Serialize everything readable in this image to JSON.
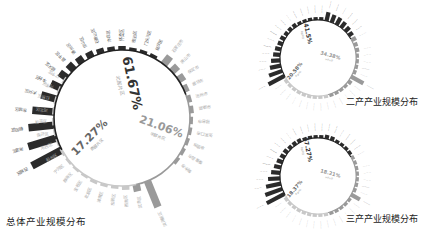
{
  "colors": {
    "dark": "#2b2b2b",
    "mid": "#9a9a9a",
    "light": "#c8c8c8",
    "ring": "#555555",
    "label": "#888888"
  },
  "chart_data": [
    {
      "type": "radial-bar",
      "title": "总体产业规模分布",
      "center": [
        122,
        118
      ],
      "radius": 68,
      "segments": [
        {
          "pct": "61.67%",
          "sub": "北部片区",
          "color": "dark",
          "start": -118,
          "end": 70,
          "labelPos": [
            128,
            84
          ],
          "rot": 78,
          "size": 13
        },
        {
          "pct": "21.06%",
          "sub": "中部片区",
          "color": "mid",
          "start": 70,
          "end": 168,
          "labelPos": [
            160,
            130
          ],
          "rot": 20,
          "size": 11
        },
        {
          "pct": "17.27%",
          "sub": "南部片区",
          "color": "light",
          "start": 168,
          "end": 242,
          "labelPos": [
            92,
            140
          ],
          "rot": -45,
          "size": 11
        }
      ],
      "bars": [
        {
          "name": "西城区",
          "angle": -118,
          "len": 34,
          "color": "dark"
        },
        {
          "name": "海淀区",
          "angle": -107,
          "len": 30,
          "color": "dark"
        },
        {
          "name": "朝阳区",
          "angle": -96,
          "len": 26,
          "color": "dark"
        },
        {
          "name": "东城区",
          "angle": -85,
          "len": 22,
          "color": "dark"
        },
        {
          "name": "大兴区",
          "angle": -74,
          "len": 16,
          "color": "dark"
        },
        {
          "name": "丰台区",
          "angle": -64,
          "len": 11,
          "color": "dark"
        },
        {
          "name": "顺义区",
          "angle": -54,
          "len": 9,
          "color": "dark"
        },
        {
          "name": "昌平区",
          "angle": -45,
          "len": 8,
          "color": "dark"
        },
        {
          "name": "通州区",
          "angle": -36,
          "len": 7,
          "color": "dark"
        },
        {
          "name": "房山区",
          "angle": -27,
          "len": 6,
          "color": "dark"
        },
        {
          "name": "石景山区",
          "angle": -18,
          "len": 5,
          "color": "dark"
        },
        {
          "name": "亦庄区",
          "angle": -9,
          "len": 4,
          "color": "dark"
        },
        {
          "name": "怀柔区",
          "angle": 0,
          "len": 4,
          "color": "dark"
        },
        {
          "name": "密云区",
          "angle": 9,
          "len": 3,
          "color": "dark"
        },
        {
          "name": "门头沟区",
          "angle": 18,
          "len": 3,
          "color": "dark"
        },
        {
          "name": "延庆区",
          "angle": 27,
          "len": 3,
          "color": "dark"
        },
        {
          "name": "石家庄市",
          "angle": 38,
          "len": 10,
          "color": "mid"
        },
        {
          "name": "唐山市",
          "angle": 47,
          "len": 8,
          "color": "mid"
        },
        {
          "name": "保定市",
          "angle": 56,
          "len": 7,
          "color": "mid"
        },
        {
          "name": "廊坊市",
          "angle": 65,
          "len": 5,
          "color": "mid"
        },
        {
          "name": "沧州市",
          "angle": 74,
          "len": 4,
          "color": "mid"
        },
        {
          "name": "邯郸市",
          "angle": 83,
          "len": 4,
          "color": "mid"
        },
        {
          "name": "邢台市",
          "angle": 92,
          "len": 3,
          "color": "mid"
        },
        {
          "name": "张家口市",
          "angle": 101,
          "len": 3,
          "color": "mid"
        },
        {
          "name": "承德市",
          "angle": 110,
          "len": 3,
          "color": "mid"
        },
        {
          "name": "秦皇岛市",
          "angle": 119,
          "len": 3,
          "color": "mid"
        },
        {
          "name": "衡水市",
          "angle": 128,
          "len": 3,
          "color": "mid"
        },
        {
          "name": "滨海新区",
          "angle": 158,
          "len": 28,
          "color": "mid"
        },
        {
          "name": "武清区",
          "angle": 168,
          "len": 7,
          "color": "mid"
        },
        {
          "name": "西青区",
          "angle": 177,
          "len": 4,
          "color": "light"
        },
        {
          "name": "东丽区",
          "angle": 186,
          "len": 3,
          "color": "light"
        },
        {
          "name": "津南区",
          "angle": 195,
          "len": 3,
          "color": "light"
        },
        {
          "name": "北辰区",
          "angle": 204,
          "len": 3,
          "color": "light"
        },
        {
          "name": "宝坻区",
          "angle": 213,
          "len": 2,
          "color": "light"
        },
        {
          "name": "静海区",
          "angle": 222,
          "len": 2,
          "color": "light"
        },
        {
          "name": "宁河区",
          "angle": 231,
          "len": 2,
          "color": "light"
        },
        {
          "name": "蓟州区",
          "angle": 240,
          "len": 2,
          "color": "light"
        },
        {
          "name": "河西区",
          "angle": 249,
          "len": 2,
          "color": "light"
        },
        {
          "name": "南开区",
          "angle": 258,
          "len": 2,
          "color": "light"
        },
        {
          "name": "和平区",
          "angle": 267,
          "len": 2,
          "color": "light"
        },
        {
          "name": "河北区",
          "angle": 276,
          "len": 2,
          "color": "light"
        },
        {
          "name": "红桥区",
          "angle": 285,
          "len": 2,
          "color": "light"
        },
        {
          "name": "河东区",
          "angle": 294,
          "len": 2,
          "color": "light"
        },
        {
          "name": "辽宁区",
          "angle": 303,
          "len": 2,
          "color": "light"
        }
      ]
    },
    {
      "type": "radial-bar",
      "title": "二产产业规模分布",
      "center": [
        318,
        58
      ],
      "radius": 38,
      "segments": [
        {
          "pct": "41.5%",
          "sub": "北部片区",
          "color": "dark",
          "start": -120,
          "end": 60,
          "labelPos": [
            306,
            34
          ],
          "rot": 78,
          "size": 6
        },
        {
          "pct": "34.38%",
          "sub": "中部片区",
          "color": "mid",
          "start": 60,
          "end": 165,
          "labelPos": [
            330,
            57
          ],
          "rot": 15,
          "size": 5
        },
        {
          "pct": "20.58%",
          "sub": "南部片区",
          "color": "light",
          "start": 165,
          "end": 240,
          "labelPos": [
            296,
            72
          ],
          "rot": -50,
          "size": 5
        }
      ],
      "bars": "generated",
      "bar_count": 44,
      "bar_pattern": [
        18,
        14,
        11,
        9,
        7,
        6,
        5,
        5,
        4,
        4,
        4,
        3,
        3,
        3,
        3,
        3,
        9,
        8,
        8,
        7,
        6,
        5,
        5,
        4,
        4,
        3,
        3,
        3,
        3,
        14,
        4,
        3,
        3,
        3,
        3,
        3,
        3,
        3,
        3,
        3,
        3,
        3,
        3,
        3
      ]
    },
    {
      "type": "radial-bar",
      "title": "三产产业规模分布",
      "center": [
        318,
        176
      ],
      "radius": 38,
      "segments": [
        {
          "pct": "67.27%",
          "sub": "北部片区",
          "color": "dark",
          "start": -120,
          "end": 60,
          "labelPos": [
            306,
            150
          ],
          "rot": 78,
          "size": 6
        },
        {
          "pct": "18.21%",
          "sub": "中部片区",
          "color": "mid",
          "start": 60,
          "end": 165,
          "labelPos": [
            330,
            175
          ],
          "rot": 15,
          "size": 5
        },
        {
          "pct": "18.37%",
          "sub": "南部片区",
          "color": "light",
          "start": 165,
          "end": 240,
          "labelPos": [
            296,
            190
          ],
          "rot": -50,
          "size": 5
        }
      ],
      "bars": "generated",
      "bar_count": 44,
      "bar_pattern": [
        20,
        18,
        15,
        12,
        9,
        7,
        6,
        5,
        5,
        4,
        4,
        4,
        3,
        3,
        3,
        3,
        4,
        4,
        3,
        3,
        3,
        3,
        3,
        3,
        3,
        3,
        3,
        3,
        3,
        10,
        3,
        3,
        3,
        3,
        3,
        3,
        3,
        3,
        3,
        3,
        3,
        3,
        3,
        3
      ]
    }
  ],
  "titles": {
    "main": "总体产业规模分布",
    "secondary": "二产产业规模分布",
    "tertiary": "三产产业规模分布"
  }
}
